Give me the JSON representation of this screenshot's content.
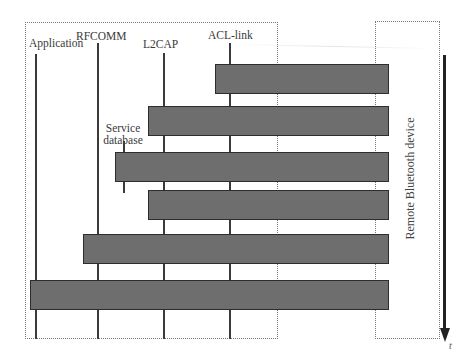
{
  "diagram": {
    "type": "sequence-diagram",
    "local_device_layers": [
      {
        "id": "application",
        "label": "Application"
      },
      {
        "id": "rfcomm",
        "label": "RFCOMM"
      },
      {
        "id": "l2cap",
        "label": "L2CAP"
      },
      {
        "id": "acl_link",
        "label": "ACL-link"
      }
    ],
    "service_database": {
      "label_line1": "Service",
      "label_line2": "database"
    },
    "remote_device": {
      "label": "Remote Bluetooth device"
    },
    "time_axis": {
      "label": "t"
    },
    "bars": [
      {
        "order": 1,
        "from": "acl_link",
        "to": "remote"
      },
      {
        "order": 2,
        "from": "l2cap",
        "to": "remote"
      },
      {
        "order": 3,
        "from": "service_database",
        "to": "remote"
      },
      {
        "order": 4,
        "from": "l2cap",
        "to": "remote"
      },
      {
        "order": 5,
        "from": "rfcomm",
        "to": "remote"
      },
      {
        "order": 6,
        "from": "application",
        "to": "remote"
      }
    ],
    "colors": {
      "bar_fill": "#6e6e6e",
      "bar_border": "#2d2d2d",
      "lifeline": "#3a3a3a",
      "frame": "#777777",
      "arrow": "#222222"
    }
  }
}
